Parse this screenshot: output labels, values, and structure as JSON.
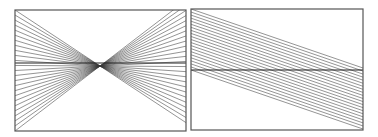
{
  "figure": {
    "width": 378,
    "height": 137,
    "background": "#ffffff",
    "stroke_color": "#3a3a3a",
    "frame_color": "#555555",
    "panels": [
      {
        "id": "left",
        "name": "converging-lines-panel",
        "frame": {
          "x": 15,
          "y": 10,
          "w": 171,
          "h": 121
        },
        "pattern": "bowtie",
        "focus": {
          "x": 100,
          "y": 66
        },
        "horizontal_line_y": 63,
        "lines_per_side": 24,
        "edge_span": {
          "top": 10,
          "bottom": 131
        }
      },
      {
        "id": "right",
        "name": "parallel-lines-panel",
        "frame": {
          "x": 191,
          "y": 9,
          "w": 172,
          "h": 121
        },
        "pattern": "parallel-sloped",
        "horizontal_line_y": 70,
        "line_count": 21,
        "left_edge_start": 9,
        "left_edge_end": 70,
        "drop": 59
      }
    ]
  }
}
